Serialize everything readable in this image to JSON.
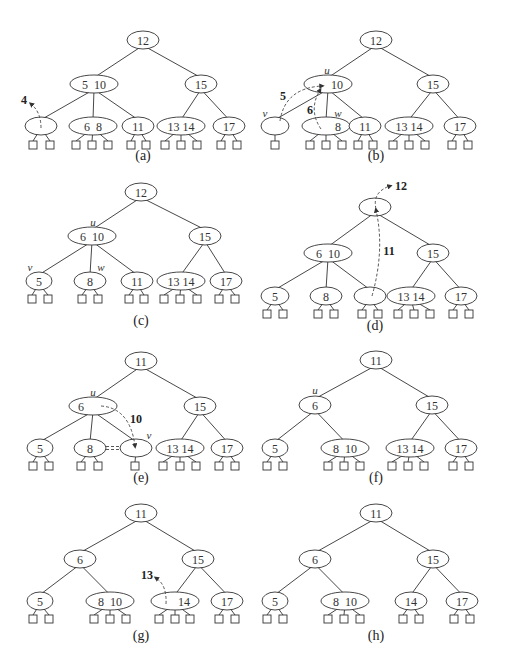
{
  "figure": {
    "panels": [
      {
        "id": "a",
        "caption": "(a)",
        "nodes": [
          {
            "id": "r",
            "x": 143,
            "y": 40,
            "rx": 16,
            "keys": "12"
          },
          {
            "id": "l",
            "x": 94,
            "y": 84,
            "rx": 24,
            "keys": "5  10"
          },
          {
            "id": "rt",
            "x": 201,
            "y": 84,
            "rx": 16,
            "keys": "15"
          },
          {
            "id": "n1",
            "x": 41,
            "y": 126,
            "rx": 16,
            "keys": "",
            "leaves": [
              33,
              50
            ]
          },
          {
            "id": "n2",
            "x": 93,
            "y": 126,
            "rx": 24,
            "keys": "6  8",
            "leaves": [
              76,
              92,
              108
            ]
          },
          {
            "id": "n3",
            "x": 138,
            "y": 126,
            "rx": 16,
            "keys": "11",
            "leaves": [
              131,
              146
            ]
          },
          {
            "id": "n4",
            "x": 181,
            "y": 126,
            "rx": 24,
            "keys": "13 14",
            "leaves": [
              165,
              181,
              197
            ]
          },
          {
            "id": "n5",
            "x": 229,
            "y": 126,
            "rx": 16,
            "keys": "17",
            "leaves": [
              221,
              237
            ]
          }
        ],
        "edges": [
          [
            "r",
            "l"
          ],
          [
            "r",
            "rt"
          ],
          [
            "l",
            "n1"
          ],
          [
            "l",
            "n2"
          ],
          [
            "l",
            "n3"
          ],
          [
            "rt",
            "n4"
          ],
          [
            "rt",
            "n5"
          ]
        ],
        "leaf_y": 145,
        "caption_y": 155,
        "moves": [
          {
            "path": "M41,128 Q41,112 31,104",
            "label": "4",
            "lx": 24,
            "ly": 100
          }
        ],
        "vertex_labels": []
      },
      {
        "id": "b",
        "caption": "(b)",
        "nodes": [
          {
            "id": "r",
            "x": 376,
            "y": 40,
            "rx": 16,
            "keys": "12"
          },
          {
            "id": "l",
            "x": 328,
            "y": 84,
            "rx": 24,
            "keys": "      10"
          },
          {
            "id": "rt",
            "x": 433,
            "y": 84,
            "rx": 16,
            "keys": "15"
          },
          {
            "id": "n1",
            "x": 275,
            "y": 126,
            "rx": 14,
            "keys": "",
            "leaves": [
              275
            ]
          },
          {
            "id": "n2",
            "x": 326,
            "y": 126,
            "rx": 24,
            "keys": "        8",
            "leaves": [
              310,
              326,
              342
            ]
          },
          {
            "id": "n3",
            "x": 365,
            "y": 126,
            "rx": 16,
            "keys": "11",
            "leaves": [
              358,
              373
            ]
          },
          {
            "id": "n4",
            "x": 409,
            "y": 126,
            "rx": 24,
            "keys": "13 14",
            "leaves": [
              393,
              409,
              425
            ]
          },
          {
            "id": "n5",
            "x": 460,
            "y": 126,
            "rx": 16,
            "keys": "17",
            "leaves": [
              452,
              468
            ]
          }
        ],
        "edges": [
          [
            "r",
            "l"
          ],
          [
            "r",
            "rt"
          ],
          [
            "l",
            "n1"
          ],
          [
            "l",
            "n2"
          ],
          [
            "l",
            "n3"
          ],
          [
            "rt",
            "n4"
          ],
          [
            "rt",
            "n5"
          ]
        ],
        "leaf_y": 145,
        "caption_y": 155,
        "moves": [
          {
            "path": "M280,121 Q285,88 322,86",
            "label": "5",
            "lx": 283,
            "ly": 96
          },
          {
            "path": "M321,129 Q308,110 320,90",
            "label": "6",
            "lx": 310,
            "ly": 110
          }
        ],
        "vertex_labels": [
          {
            "text": "u",
            "x": 327,
            "y": 70
          },
          {
            "text": "v",
            "x": 265,
            "y": 113
          },
          {
            "text": "w",
            "x": 338,
            "y": 113
          }
        ]
      },
      {
        "id": "c",
        "caption": "(c)",
        "nodes": [
          {
            "id": "r",
            "x": 141,
            "y": 192,
            "rx": 16,
            "keys": "12"
          },
          {
            "id": "l",
            "x": 92,
            "y": 236,
            "rx": 24,
            "keys": "6  10"
          },
          {
            "id": "rt",
            "x": 205,
            "y": 236,
            "rx": 16,
            "keys": "15"
          },
          {
            "id": "n1",
            "x": 39,
            "y": 281,
            "rx": 13,
            "keys": "5",
            "leaves": [
              32,
              48
            ]
          },
          {
            "id": "n2",
            "x": 90,
            "y": 281,
            "rx": 16,
            "keys": "8",
            "leaves": [
              82,
              98
            ]
          },
          {
            "id": "n3",
            "x": 137,
            "y": 281,
            "rx": 16,
            "keys": "11",
            "leaves": [
              129,
              144
            ]
          },
          {
            "id": "n4",
            "x": 181,
            "y": 281,
            "rx": 24,
            "keys": "13 14",
            "leaves": [
              164,
              180,
              197
            ]
          },
          {
            "id": "n5",
            "x": 226,
            "y": 281,
            "rx": 16,
            "keys": "17",
            "leaves": [
              219,
              235
            ]
          }
        ],
        "edges": [
          [
            "r",
            "l"
          ],
          [
            "r",
            "rt"
          ],
          [
            "l",
            "n1"
          ],
          [
            "l",
            "n2"
          ],
          [
            "l",
            "n3"
          ],
          [
            "rt",
            "n4"
          ],
          [
            "rt",
            "n5"
          ]
        ],
        "leaf_y": 299,
        "caption_y": 320,
        "moves": [],
        "vertex_labels": [
          {
            "text": "u",
            "x": 93,
            "y": 222
          },
          {
            "text": "v",
            "x": 30,
            "y": 267
          },
          {
            "text": "w",
            "x": 101,
            "y": 267
          }
        ]
      },
      {
        "id": "d",
        "caption": "(d)",
        "nodes": [
          {
            "id": "r",
            "x": 375,
            "y": 207,
            "rx": 16,
            "keys": ""
          },
          {
            "id": "l",
            "x": 328,
            "y": 253,
            "rx": 24,
            "keys": "6  10"
          },
          {
            "id": "rt",
            "x": 433,
            "y": 253,
            "rx": 16,
            "keys": "15"
          },
          {
            "id": "n1",
            "x": 275,
            "y": 296,
            "rx": 14,
            "keys": "5",
            "leaves": [
              267,
              283
            ]
          },
          {
            "id": "n2",
            "x": 326,
            "y": 296,
            "rx": 16,
            "keys": "8",
            "leaves": [
              318,
              334
            ]
          },
          {
            "id": "n3",
            "x": 370,
            "y": 296,
            "rx": 16,
            "keys": "",
            "leaves": [
              362,
              378
            ]
          },
          {
            "id": "n4",
            "x": 411,
            "y": 296,
            "rx": 24,
            "keys": "13 14",
            "leaves": [
              398,
              414,
              430
            ]
          },
          {
            "id": "n5",
            "x": 461,
            "y": 296,
            "rx": 16,
            "keys": "17",
            "leaves": [
              453,
              469
            ]
          }
        ],
        "edges": [
          [
            "r",
            "l"
          ],
          [
            "r",
            "rt"
          ],
          [
            "l",
            "n1"
          ],
          [
            "l",
            "n2"
          ],
          [
            "l",
            "n3"
          ],
          [
            "rt",
            "n4"
          ],
          [
            "rt",
            "n5"
          ]
        ],
        "leaf_y": 314,
        "caption_y": 325,
        "moves": [
          {
            "path": "M372,296 Q385,250 376,210",
            "label": "11",
            "lx": 389,
            "ly": 251
          },
          {
            "path": "M376,209 Q372,192 390,186",
            "label": "12",
            "lx": 401,
            "ly": 186
          }
        ],
        "vertex_labels": []
      },
      {
        "id": "e",
        "caption": "(e)",
        "nodes": [
          {
            "id": "r",
            "x": 141,
            "y": 361,
            "rx": 16,
            "keys": "11"
          },
          {
            "id": "l",
            "x": 93,
            "y": 406,
            "rx": 24,
            "keys": "6        "
          },
          {
            "id": "rt",
            "x": 200,
            "y": 406,
            "rx": 16,
            "keys": "15"
          },
          {
            "id": "n1",
            "x": 40,
            "y": 448,
            "rx": 13,
            "keys": "5",
            "leaves": [
              33,
              49
            ]
          },
          {
            "id": "n2",
            "x": 90,
            "y": 448,
            "rx": 16,
            "keys": "8",
            "leaves": [
              81,
              98
            ]
          },
          {
            "id": "n3",
            "x": 136,
            "y": 448,
            "rx": 16,
            "keys": "",
            "leaves": [
              135
            ]
          },
          {
            "id": "n4",
            "x": 180,
            "y": 448,
            "rx": 24,
            "keys": "13 14",
            "leaves": [
              163,
              180,
              196
            ]
          },
          {
            "id": "n5",
            "x": 227,
            "y": 448,
            "rx": 16,
            "keys": "17",
            "leaves": [
              219,
              235
            ]
          }
        ],
        "edges": [
          [
            "r",
            "l"
          ],
          [
            "r",
            "rt"
          ],
          [
            "l",
            "n1"
          ],
          [
            "l",
            "n2"
          ],
          [
            "l",
            "n3"
          ],
          [
            "rt",
            "n4"
          ],
          [
            "rt",
            "n5"
          ]
        ],
        "leaf_y": 466,
        "caption_y": 477,
        "moves": [
          {
            "path": "M101,406 Q130,408 135,446",
            "label": "10",
            "lx": 136,
            "ly": 419
          }
        ],
        "double_dash": {
          "x1": 106,
          "x2": 120,
          "y": 448
        },
        "vertex_labels": [
          {
            "text": "u",
            "x": 93,
            "y": 392
          },
          {
            "text": "v",
            "x": 149,
            "y": 435
          }
        ]
      },
      {
        "id": "f",
        "caption": "(f)",
        "nodes": [
          {
            "id": "r",
            "x": 376,
            "y": 360,
            "rx": 16,
            "keys": "11"
          },
          {
            "id": "l",
            "x": 315,
            "y": 405,
            "rx": 16,
            "keys": "6"
          },
          {
            "id": "rt",
            "x": 432,
            "y": 405,
            "rx": 16,
            "keys": "15"
          },
          {
            "id": "n1",
            "x": 275,
            "y": 448,
            "rx": 13,
            "keys": "5",
            "leaves": [
              267,
              283
            ]
          },
          {
            "id": "n2",
            "x": 345,
            "y": 448,
            "rx": 24,
            "keys": "8  10",
            "leaves": [
              328,
              344,
              360
            ]
          },
          {
            "id": "n4",
            "x": 410,
            "y": 448,
            "rx": 24,
            "keys": "13 14",
            "leaves": [
              392,
              408,
              424
            ]
          },
          {
            "id": "n5",
            "x": 461,
            "y": 448,
            "rx": 16,
            "keys": "17",
            "leaves": [
              453,
              469
            ]
          }
        ],
        "edges": [
          [
            "r",
            "l"
          ],
          [
            "r",
            "rt"
          ],
          [
            "l",
            "n1"
          ],
          [
            "l",
            "n2"
          ],
          [
            "rt",
            "n4"
          ],
          [
            "rt",
            "n5"
          ]
        ],
        "leaf_y": 466,
        "caption_y": 477,
        "moves": [],
        "vertex_labels": [
          {
            "text": "u",
            "x": 315,
            "y": 390
          }
        ]
      },
      {
        "id": "g",
        "caption": "(g)",
        "nodes": [
          {
            "id": "r",
            "x": 141,
            "y": 513,
            "rx": 16,
            "keys": "11"
          },
          {
            "id": "l",
            "x": 80,
            "y": 559,
            "rx": 16,
            "keys": "6"
          },
          {
            "id": "rt",
            "x": 198,
            "y": 559,
            "rx": 16,
            "keys": "15"
          },
          {
            "id": "n1",
            "x": 40,
            "y": 601,
            "rx": 13,
            "keys": "5",
            "leaves": [
              33,
              49
            ]
          },
          {
            "id": "n2",
            "x": 110,
            "y": 601,
            "rx": 24,
            "keys": "8  10",
            "leaves": [
              94,
              110,
              126
            ]
          },
          {
            "id": "n4",
            "x": 175,
            "y": 601,
            "rx": 24,
            "keys": "      14",
            "leaves": [
              159,
              175,
              190
            ]
          },
          {
            "id": "n5",
            "x": 227,
            "y": 601,
            "rx": 16,
            "keys": "17",
            "leaves": [
              219,
              235
            ]
          }
        ],
        "edges": [
          [
            "r",
            "l"
          ],
          [
            "r",
            "rt"
          ],
          [
            "l",
            "n1"
          ],
          [
            "l",
            "n2"
          ],
          [
            "rt",
            "n4"
          ],
          [
            "rt",
            "n5"
          ]
        ],
        "leaf_y": 619,
        "caption_y": 635,
        "moves": [
          {
            "path": "M166,604 Q167,585 156,578",
            "label": "13",
            "lx": 147,
            "ly": 575
          }
        ],
        "vertex_labels": []
      },
      {
        "id": "h",
        "caption": "(h)",
        "nodes": [
          {
            "id": "r",
            "x": 376,
            "y": 513,
            "rx": 16,
            "keys": "11"
          },
          {
            "id": "l",
            "x": 315,
            "y": 559,
            "rx": 16,
            "keys": "6"
          },
          {
            "id": "rt",
            "x": 433,
            "y": 559,
            "rx": 16,
            "keys": "15"
          },
          {
            "id": "n1",
            "x": 275,
            "y": 601,
            "rx": 13,
            "keys": "5",
            "leaves": [
              267,
              283
            ]
          },
          {
            "id": "n2",
            "x": 345,
            "y": 601,
            "rx": 24,
            "keys": "8  10",
            "leaves": [
              328,
              344,
              360
            ]
          },
          {
            "id": "n4",
            "x": 411,
            "y": 601,
            "rx": 16,
            "keys": "14",
            "leaves": [
              403,
              419
            ]
          },
          {
            "id": "n5",
            "x": 462,
            "y": 601,
            "rx": 16,
            "keys": "17",
            "leaves": [
              454,
              470
            ]
          }
        ],
        "edges": [
          [
            "r",
            "l"
          ],
          [
            "r",
            "rt"
          ],
          [
            "l",
            "n1"
          ],
          [
            "l",
            "n2"
          ],
          [
            "rt",
            "n4"
          ],
          [
            "rt",
            "n5"
          ]
        ],
        "leaf_y": 619,
        "caption_y": 635,
        "moves": [],
        "vertex_labels": []
      }
    ]
  }
}
